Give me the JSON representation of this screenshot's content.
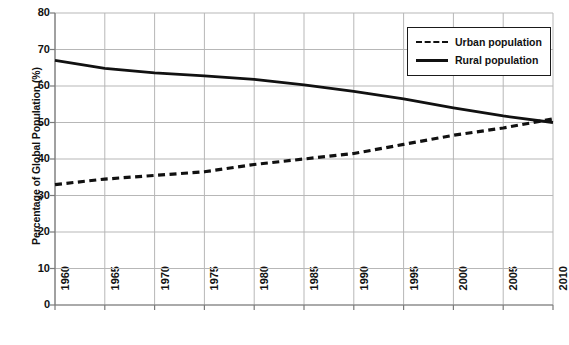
{
  "chart_data": {
    "type": "line",
    "title": "",
    "subtitle": "",
    "xlabel": "",
    "ylabel": "Percentage of Global Population (%)",
    "xlim": [
      1960,
      2010
    ],
    "ylim": [
      0,
      80
    ],
    "grid": true,
    "legend_position": "top-right",
    "x": [
      1960,
      1965,
      1970,
      1975,
      1980,
      1985,
      1990,
      1995,
      2000,
      2005,
      2010
    ],
    "categories": [
      "1960",
      "1965",
      "1970",
      "1975",
      "1980",
      "1985",
      "1990",
      "1995",
      "2000",
      "2005",
      "2010"
    ],
    "series": [
      {
        "name": "Urban population",
        "style": "dashed",
        "color": "#111111",
        "values": [
          33,
          34.5,
          35.5,
          36.5,
          38.5,
          40,
          41.5,
          44,
          46.5,
          48.5,
          51
        ]
      },
      {
        "name": "Rural population",
        "style": "solid",
        "color": "#111111",
        "values": [
          67,
          64.8,
          63.6,
          62.8,
          61.8,
          60.3,
          58.5,
          56.5,
          54,
          51.8,
          50
        ]
      }
    ],
    "ytick_labels": [
      "0",
      "10",
      "20",
      "30",
      "40",
      "50",
      "60",
      "70",
      "80"
    ],
    "ytick_values": [
      0,
      10,
      20,
      30,
      40,
      50,
      60,
      70,
      80
    ],
    "xtick_labels": [
      "1960",
      "1965",
      "1970",
      "1975",
      "1980",
      "1985",
      "1990",
      "1995",
      "2000",
      "2005",
      "2010"
    ]
  },
  "axes": {
    "y_title": "Percentage of Global Population (%)"
  },
  "legend": {
    "entries": [
      {
        "label": "Urban population",
        "style": "dashed"
      },
      {
        "label": "Rural population",
        "style": "solid"
      }
    ]
  },
  "colors": {
    "ink": "#111111",
    "grid": "#b7b7b7",
    "axis": "#7a7a7a",
    "background": "#ffffff"
  }
}
